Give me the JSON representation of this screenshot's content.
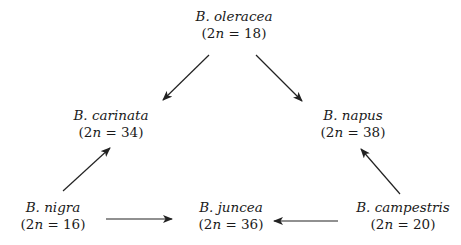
{
  "diagram": {
    "type": "triangle of U (Brassica genome relationships)",
    "colors": {
      "background": "#ffffff",
      "text": "#1a1a1a",
      "arrow": "#222222"
    },
    "nodes": {
      "oleracea": {
        "species": "B. oleracea",
        "chrom_prefix": "(2",
        "chrom_n": "n",
        "chrom_suffix": " = 18)",
        "x": 234,
        "y": 8
      },
      "carinata": {
        "species": "B. carinata",
        "chrom_prefix": "(2",
        "chrom_n": "n",
        "chrom_suffix": " = 34)",
        "x": 111,
        "y": 107
      },
      "napus": {
        "species": "B. napus",
        "chrom_prefix": "(2",
        "chrom_n": "n",
        "chrom_suffix": " = 38)",
        "x": 353,
        "y": 107
      },
      "nigra": {
        "species": "B. nigra",
        "chrom_prefix": "(2",
        "chrom_n": "n",
        "chrom_suffix": " = 16)",
        "x": 53,
        "y": 199
      },
      "juncea": {
        "species": "B. juncea",
        "chrom_prefix": "(2",
        "chrom_n": "n",
        "chrom_suffix": " = 36)",
        "x": 231,
        "y": 199
      },
      "campestris": {
        "species": "B. campestris",
        "chrom_prefix": "(2",
        "chrom_n": "n",
        "chrom_suffix": " = 20)",
        "x": 403,
        "y": 199
      }
    },
    "edges": [
      {
        "from": "B. oleracea",
        "to": "B. carinata",
        "x1": 209,
        "y1": 55,
        "x2": 163,
        "y2": 100
      },
      {
        "from": "B. oleracea",
        "to": "B. napus",
        "x1": 256,
        "y1": 55,
        "x2": 302,
        "y2": 101
      },
      {
        "from": "B. nigra",
        "to": "B. carinata",
        "x1": 63,
        "y1": 191,
        "x2": 110,
        "y2": 148
      },
      {
        "from": "B. campestris",
        "to": "B. napus",
        "x1": 400,
        "y1": 194,
        "x2": 361,
        "y2": 149
      },
      {
        "from": "B. nigra",
        "to": "B. juncea",
        "x1": 106,
        "y1": 219,
        "x2": 172,
        "y2": 219
      },
      {
        "from": "B. campestris",
        "to": "B. juncea",
        "x1": 338,
        "y1": 221,
        "x2": 274,
        "y2": 221
      }
    ]
  }
}
